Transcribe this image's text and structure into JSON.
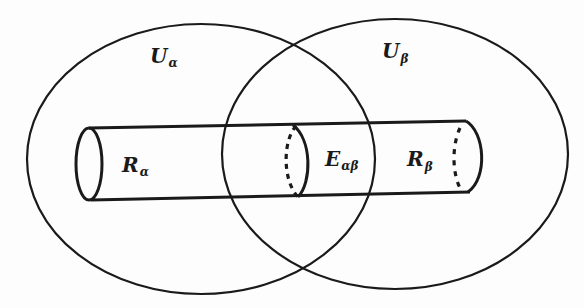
{
  "diagram": {
    "type": "venn-with-cylinder",
    "colors": {
      "stroke": "#1a1a1a",
      "background": "#fdfdfd"
    },
    "regions": [
      {
        "id": "U_alpha",
        "label_main": "U",
        "label_sub": "α"
      },
      {
        "id": "U_beta",
        "label_main": "U",
        "label_sub": "β"
      }
    ],
    "cylinder_parts": [
      {
        "id": "R_alpha",
        "label_main": "R",
        "label_sub": "α"
      },
      {
        "id": "E_alpha_beta",
        "label_main": "E",
        "label_sub": "αβ"
      },
      {
        "id": "R_beta",
        "label_main": "R",
        "label_sub": "β"
      }
    ]
  }
}
